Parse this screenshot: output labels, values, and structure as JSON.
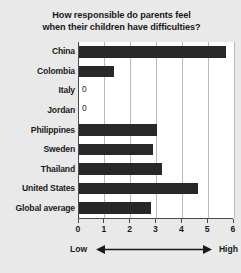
{
  "chart_data": {
    "type": "bar",
    "orientation": "horizontal",
    "title": "How responsible do parents feel when their children have difficulties?",
    "title_lines": [
      "How responsible do parents feel",
      "when their children have difficulties?"
    ],
    "categories": [
      "China",
      "Colombia",
      "Italy",
      "Jordan",
      "Philippines",
      "Sweden",
      "Thailand",
      "United States",
      "Global average"
    ],
    "values": [
      5.7,
      1.35,
      0,
      0,
      3.0,
      2.85,
      3.2,
      4.6,
      2.8
    ],
    "value_labels": [
      "",
      "",
      "0",
      "0",
      "",
      "",
      "",
      "",
      ""
    ],
    "xlabel": "",
    "ylabel": "",
    "xlim": [
      0,
      6
    ],
    "xticks": [
      0,
      1,
      2,
      3,
      4,
      5,
      6
    ],
    "xtick_labels": [
      "0",
      "1",
      "2",
      "3",
      "4",
      "5",
      "6"
    ],
    "grid": true,
    "grid_axis": "x",
    "legend": false,
    "axis_low_label": "Low",
    "axis_high_label": "High",
    "bar_color": "#282828",
    "plot_background": "#ffffff",
    "figure_background": "#e9e9e9",
    "grid_color": "#b9b9b9",
    "axis_color": "#4a4a4a",
    "text_color": "#1a1a1a"
  }
}
